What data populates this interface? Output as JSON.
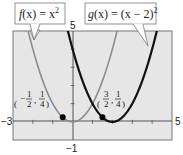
{
  "chart_data": {
    "type": "line",
    "title": "",
    "xlabel": "",
    "ylabel": "",
    "xlim": [
      -3,
      5
    ],
    "ylim": [
      -1,
      5
    ],
    "grid": false,
    "background": "#e6e6e6",
    "axis_tick_labels": {
      "x_min": "−3",
      "x_max": "5",
      "y_min": "−1",
      "y_max": "5"
    },
    "series": [
      {
        "name": "f(x) = x²",
        "function": "x^2",
        "color": "#8c8c8c",
        "line_width": 1.6,
        "label_parts": {
          "f": "f",
          "open": "(x) = x",
          "sup": "2"
        }
      },
      {
        "name": "g(x) = (x − 2)²",
        "function": "(x-2)^2",
        "color": "#111111",
        "line_width": 2.2,
        "label_parts": {
          "g": "g",
          "open": "(x) = (x − 2)",
          "sup": "2"
        }
      }
    ],
    "points": [
      {
        "x": -0.5,
        "y": 0.25,
        "label": "(−1/2, 1/4)",
        "num_x": "1",
        "den_x": "2",
        "num_y": "1",
        "den_y": "4",
        "neg_x": "−"
      },
      {
        "x": 1.5,
        "y": 0.25,
        "label": "(3/2, 1/4)",
        "num_x": "3",
        "den_x": "2",
        "num_y": "1",
        "den_y": "4",
        "neg_x": ""
      }
    ],
    "annotations": [
      {
        "text": "f(x) = x²",
        "type": "callout",
        "points_to": "f"
      },
      {
        "text": "g(x) = (x − 2)²",
        "type": "callout",
        "points_to": "g"
      }
    ]
  }
}
